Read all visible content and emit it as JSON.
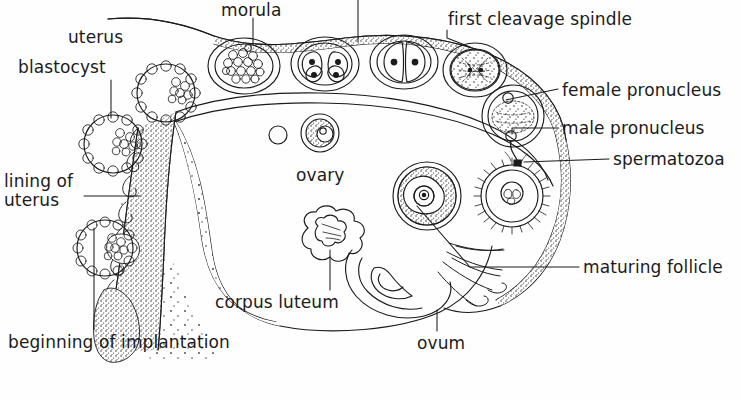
{
  "diagram": {
    "style": {
      "background": "#fefefe",
      "ink": "#1b1b1b",
      "stipple": "#2a2a2a"
    },
    "labels": {
      "uterus_top": "uterus",
      "blastocyst": "blastocyst",
      "lining_of_uterus": "lining of\nuterus",
      "lining_line1": "lining of",
      "lining_line2": "uterus",
      "beginning_of_implantation": "beginning of implantation",
      "morula": "morula",
      "ovary": "ovary",
      "corpus_luteum": "corpus luteum",
      "ovum": "ovum",
      "first_cleavage_spindle": "first cleavage spindle",
      "female_pronucleus": "female pronucleus",
      "male_pronucleus": "male pronucleus",
      "spermatozoa": "spermatozoa",
      "maturing_follicle": "maturing follicle"
    },
    "structures": [
      {
        "name": "uterus-cavity",
        "description": "uterine cavity with stippled endometrial lining"
      },
      {
        "name": "morula",
        "description": "solid ball of blastomeres inside zona pellucida"
      },
      {
        "name": "four-cell-stage",
        "description": "four-cell cleavage embryo"
      },
      {
        "name": "two-cell-stage",
        "description": "two-cell cleavage embryo"
      },
      {
        "name": "first-cleavage-spindle",
        "description": "zygote with mitotic spindle"
      },
      {
        "name": "fertilized-ovum",
        "description": "ovum containing male and female pronuclei"
      },
      {
        "name": "spermatozoa",
        "description": "sperm approaching the ovum"
      },
      {
        "name": "ovum",
        "description": "released ovum with corona radiata"
      },
      {
        "name": "maturing-follicle",
        "description": "graafian follicle with antrum and oocyte"
      },
      {
        "name": "corpus-luteum",
        "description": "scalloped glandular body in ovary"
      },
      {
        "name": "ovary",
        "description": "ovary with developing follicles"
      },
      {
        "name": "fimbriae",
        "description": "finger-like projections of the uterine tube"
      },
      {
        "name": "blastocyst",
        "description": "hollow blastocyst with inner cell mass"
      },
      {
        "name": "implanting-blastocyst",
        "description": "blastocyst embedding in uterine lining"
      }
    ]
  }
}
